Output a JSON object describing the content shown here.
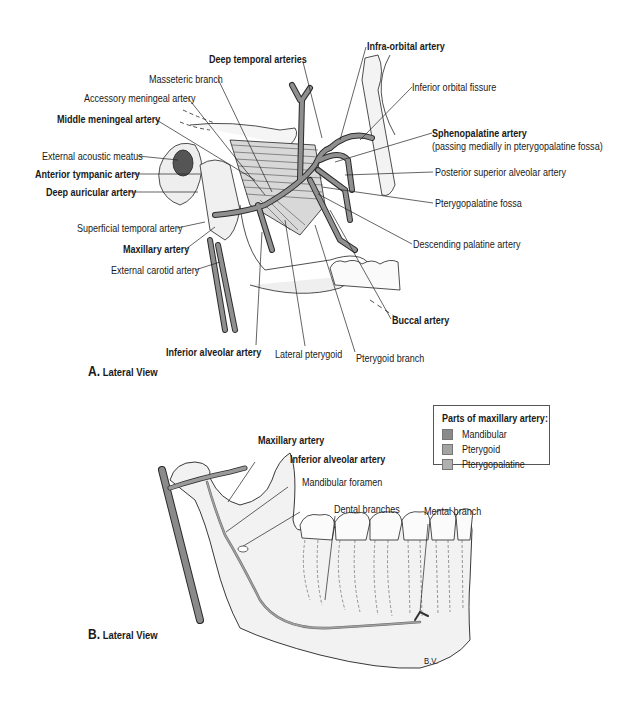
{
  "figure_a": {
    "view_letter": "A.",
    "view_label": "Lateral View",
    "labels": {
      "deep_temporal_arteries": "Deep temporal arteries",
      "infra_orbital_artery": "Infra-orbital artery",
      "masseteric_branch": "Masseteric branch",
      "accessory_meningeal_artery": "Accessory meningeal artery",
      "inferior_orbital_fissure": "Inferior orbital fissure",
      "middle_meningeal_artery": "Middle meningeal artery",
      "sphenopalatine_artery": "Sphenopalatine artery",
      "sphenopalatine_note": "(passing medially in pterygopalatine fossa)",
      "external_acoustic_meatus": "External acoustic meatus",
      "anterior_tympanic_artery": "Anterior tympanic artery",
      "posterior_superior_alveolar_artery": "Posterior superior alveolar artery",
      "deep_auricular_artery": "Deep auricular artery",
      "pterygopalatine_fossa": "Pterygopalatine fossa",
      "superficial_temporal_artery": "Superficial temporal artery",
      "descending_palatine_artery": "Descending palatine artery",
      "maxillary_artery": "Maxillary artery",
      "external_carotid_artery": "External carotid artery",
      "buccal_artery": "Buccal artery",
      "inferior_alveolar_artery": "Inferior alveolar artery",
      "lateral_pterygoid": "Lateral pterygoid",
      "pterygoid_branch": "Pterygoid branch"
    }
  },
  "legend": {
    "title": "Parts of maxillary artery:",
    "items": [
      {
        "label": "Mandibular",
        "color": "#8a8a8a"
      },
      {
        "label": "Pterygoid",
        "color": "#a3a3a3"
      },
      {
        "label": "Pterygopalatine",
        "color": "#b0b0b0"
      }
    ]
  },
  "figure_b": {
    "view_letter": "B.",
    "view_label": "Lateral View",
    "labels": {
      "maxillary_artery": "Maxillary artery",
      "inferior_alveolar_artery": "Inferior alveolar artery",
      "mandibular_foramen": "Mandibular foramen",
      "dental_branches": "Dental branches",
      "mental_branch": "Mental branch"
    },
    "signature": "B.V."
  },
  "colors": {
    "artery_fill": "#8f8f8f",
    "artery_stroke": "#2a2a2a",
    "bone_fill": "#f2f2f2",
    "line": "#222222"
  }
}
